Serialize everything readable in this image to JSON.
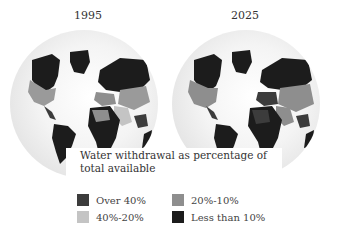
{
  "maps": [
    {
      "year": "1995"
    },
    {
      "year": "2025"
    }
  ],
  "caption": {
    "line1": "Water withdrawal as percentage of",
    "line2": "total available"
  },
  "legend": [
    {
      "label": "Over 40%",
      "color": "#3c3c3c"
    },
    {
      "label": "40%-20%",
      "color": "#c4c4c4"
    },
    {
      "label": "20%-10%",
      "color": "#8e8e8e"
    },
    {
      "label": "Less than 10%",
      "color": "#1c1c1c"
    }
  ]
}
